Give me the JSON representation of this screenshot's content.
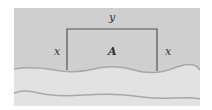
{
  "figure": {
    "labels": {
      "top_side": "y",
      "left_side": "x",
      "right_side": "x",
      "area": "A"
    },
    "colors": {
      "land": "#cfcfcf",
      "river": "#e2e2e2",
      "fence": "#555555",
      "bank": "#a8a8a8"
    }
  }
}
